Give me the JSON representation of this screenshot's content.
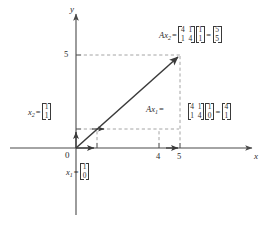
{
  "figure": {
    "kind": "linear-algebra-vector-diagram",
    "axes": {
      "x_label": "x",
      "y_label": "y",
      "origin_label": "0",
      "x_ticks": [
        "4",
        "5"
      ],
      "y_ticks": [
        "5"
      ]
    },
    "matrix_A": {
      "rows": [
        [
          "4",
          "1"
        ],
        [
          "1",
          "4"
        ]
      ]
    },
    "vectors": {
      "x1": {
        "name": "x",
        "sub": "1",
        "components": [
          [
            "1"
          ],
          [
            "0"
          ]
        ],
        "equals": "="
      },
      "x2": {
        "name": "x",
        "sub": "2",
        "components": [
          [
            "1"
          ],
          [
            "1"
          ]
        ],
        "equals": "="
      }
    },
    "equations": [
      {
        "lhs_name": "Ax",
        "lhs_sub": "2",
        "eq1": "=",
        "matrix": [
          [
            "4",
            "1"
          ],
          [
            "1",
            "4"
          ]
        ],
        "input": [
          [
            "1"
          ],
          [
            "1"
          ]
        ],
        "eq2": "=",
        "result": [
          [
            "5"
          ],
          [
            "5"
          ]
        ]
      },
      {
        "lhs_name": "Ax",
        "lhs_sub": "1",
        "eq1": "=",
        "matrix": [
          [
            "4",
            "1"
          ],
          [
            "1",
            "4"
          ]
        ],
        "input": [
          [
            "1"
          ],
          [
            "0"
          ]
        ],
        "eq2": "=",
        "result": [
          [
            "4"
          ],
          [
            "1"
          ]
        ]
      }
    ],
    "colors": {
      "axis": "#4a4a4a",
      "vector": "#3a3a3a",
      "dashed": "#9a9a9a",
      "text": "#2b2b2b",
      "background": "#ffffff"
    }
  }
}
